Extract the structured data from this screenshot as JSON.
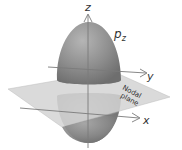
{
  "diagram": {
    "orbital_label": {
      "main": "p",
      "subscript": "z"
    },
    "axes": {
      "z": "z",
      "y": "y",
      "x": "x"
    },
    "plane_label": {
      "line1": "Nodal",
      "line2": "plane"
    },
    "colors": {
      "lobe": "#8c8c8c",
      "lobe_highlight": "#b5b5b5",
      "lobe_shadow": "#6e6e6e",
      "plane": "#d4d4d4",
      "axis": "#7a7a7a",
      "background": "#ffffff"
    }
  }
}
